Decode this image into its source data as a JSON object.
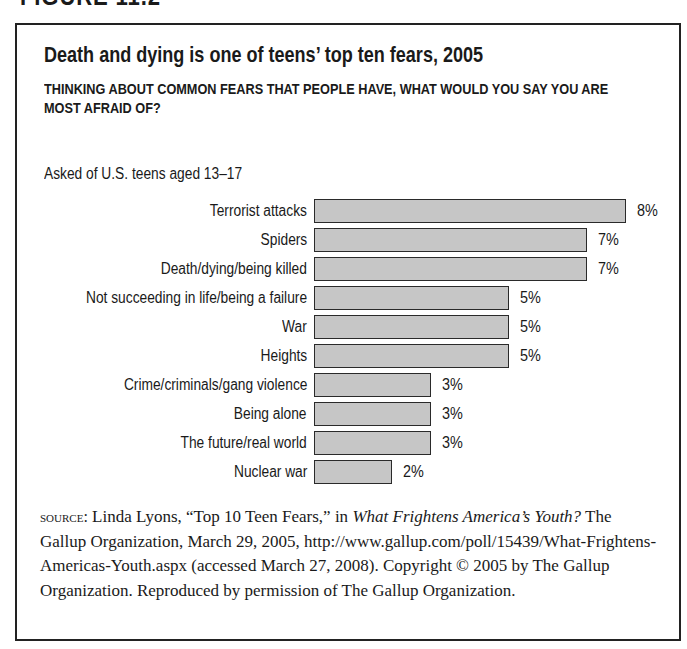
{
  "figure_label": "FIGURE 11.2",
  "title": "Death and dying is one of teens’ top ten fears, 2005",
  "subtitle": "THINKING ABOUT COMMON FEARS THAT PEOPLE HAVE, WHAT WOULD YOU SAY YOU ARE MOST AFRAID OF?",
  "note": "Asked of U.S. teens aged 13–17",
  "colors": {
    "bar_fill": "#c6c6c6",
    "bar_border": "#2a2a2a",
    "frame": "#222222"
  },
  "chart_data": {
    "type": "bar",
    "orientation": "horizontal",
    "title": "Death and dying is one of teens’ top ten fears, 2005",
    "subtitle": "THINKING ABOUT COMMON FEARS THAT PEOPLE HAVE, WHAT WOULD YOU SAY YOU ARE MOST AFRAID OF?",
    "annotation": "Asked of U.S. teens aged 13–17",
    "categories": [
      "Terrorist attacks",
      "Spiders",
      "Death/dying/being killed",
      "Not succeeding in life/being a failure",
      "War",
      "Heights",
      "Crime/criminals/gang violence",
      "Being alone",
      "The future/real world",
      "Nuclear war"
    ],
    "values": [
      8,
      7,
      7,
      5,
      5,
      5,
      3,
      3,
      3,
      2
    ],
    "value_labels": [
      "8%",
      "7%",
      "7%",
      "5%",
      "5%",
      "5%",
      "3%",
      "3%",
      "3%",
      "2%"
    ],
    "xlabel": "",
    "ylabel": "",
    "unit": "%",
    "grid": false,
    "legend": null,
    "axis_visible": false
  },
  "source": {
    "label": "SOURCE:",
    "text_1": " Linda Lyons, “Top 10 Teen Fears,” in ",
    "italic_title": "What Frightens America’s Youth?",
    "text_2": " The Gallup Organization, March 29, 2005, http://www.gallup.com/poll/15439/What-Frightens-Americas-Youth.aspx (accessed March 27, 2008). Copyright © 2005 by The Gallup Organization. Reproduced by permission of The Gallup Organization."
  }
}
